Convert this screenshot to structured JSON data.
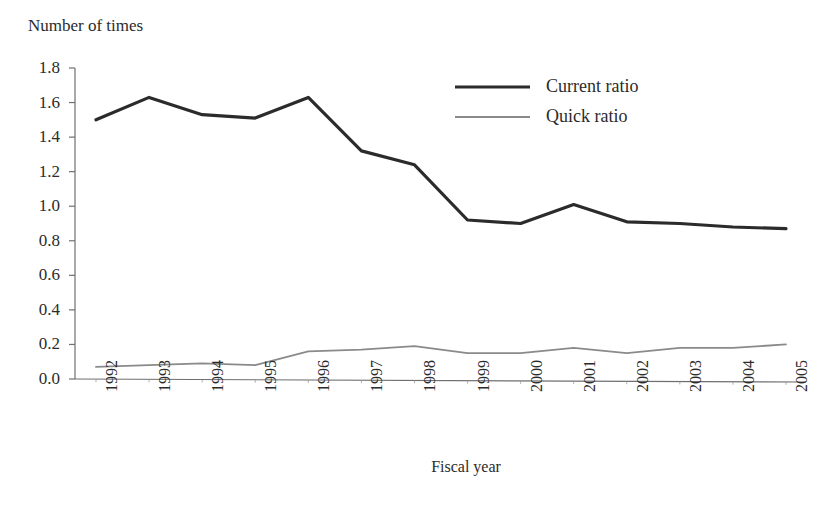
{
  "chart_data": {
    "type": "line",
    "title": "",
    "ylabel": "Number of times",
    "xlabel": "Fiscal year",
    "categories": [
      "1992",
      "1993",
      "1994",
      "1995",
      "1996",
      "1997",
      "1998",
      "1999",
      "2000",
      "2001",
      "2002",
      "2003",
      "2004",
      "2005"
    ],
    "ylim": [
      0.0,
      1.8
    ],
    "y_ticks": [
      "0.0",
      "0.2",
      "0.4",
      "0.6",
      "0.8",
      "1.0",
      "1.2",
      "1.4",
      "1.6",
      "1.8"
    ],
    "grid": false,
    "legend_position": "top-right-inside",
    "series": [
      {
        "name": "Current ratio",
        "color": "#2b2b2b",
        "width": 3.2,
        "values": [
          1.5,
          1.63,
          1.53,
          1.51,
          1.63,
          1.32,
          1.24,
          0.92,
          0.9,
          1.01,
          0.91,
          0.9,
          0.88,
          0.87
        ]
      },
      {
        "name": "Quick ratio",
        "color": "#8a8a8a",
        "width": 1.8,
        "values": [
          0.07,
          0.08,
          0.09,
          0.08,
          0.16,
          0.17,
          0.19,
          0.15,
          0.15,
          0.18,
          0.15,
          0.18,
          0.18,
          0.2
        ]
      }
    ]
  },
  "legend": {
    "items": [
      {
        "label": "Current ratio"
      },
      {
        "label": "Quick ratio"
      }
    ]
  },
  "axis": {
    "y_title": "Number of times",
    "x_title": "Fiscal year"
  }
}
